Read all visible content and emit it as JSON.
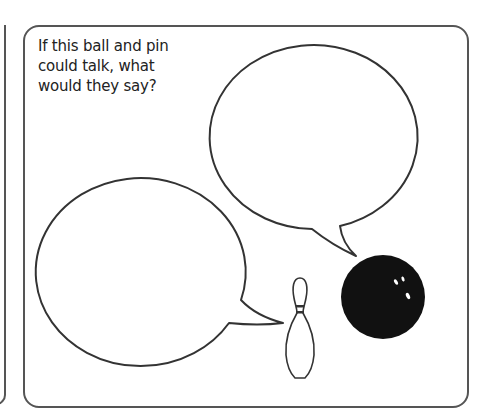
{
  "worksheet": {
    "prompt_lines": [
      "If this ball and pin",
      "could talk, what",
      "would they say?"
    ],
    "speech_bubbles": [
      {
        "id": "ball-bubble",
        "content": ""
      },
      {
        "id": "pin-bubble",
        "content": ""
      }
    ],
    "illustrations": [
      "bowling-pin",
      "bowling-ball"
    ],
    "colors": {
      "border": "#555555",
      "ink": "#222222",
      "ball": "#111111",
      "background": "#ffffff"
    }
  }
}
